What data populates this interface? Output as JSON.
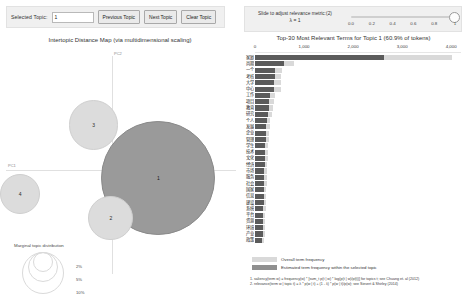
{
  "controls": {
    "selected_topic_label": "Selected Topic:",
    "selected_topic_value": "1",
    "previous_topic": "Previous Topic",
    "next_topic": "Next Topic",
    "clear_topic": "Clear Topic",
    "slider_caption": "Slide to adjust relevance metric:(2)",
    "lambda_label": "λ = 1",
    "slider_ticks": [
      "0.0",
      "0.2",
      "0.4",
      "0.6",
      "0.8",
      "1"
    ],
    "slider_value": 1
  },
  "left_panel": {
    "title": "Intertopic Distance Map (via multidimensional scaling)",
    "axis_x_label": "PC1",
    "axis_y_label": "PC2",
    "marginal_title": "Marginal topic distribution",
    "marginal_sizes": [
      "2%",
      "5%",
      "10%"
    ]
  },
  "right_panel": {
    "title": "Top-30 Most Relevant Terms for Topic 1 (60.9% of tokens)",
    "axis_ticks": [
      "0",
      "1,000",
      "2,000",
      "3,000",
      "4,000"
    ],
    "legend_overall": "Overall term frequency",
    "legend_topic": "Estimated term frequency within the selected topic",
    "footnote1": "1. saliency(term w) = frequency(w) * [sum_t p(t | w) * log(p(t | w)/p(t))] for topics t; see Chuang et. al (2012)",
    "footnote2": "2. relevance(term w | topic t) = λ * p(w | t) + (1 - λ) * p(w | t)/p(w); see Sievert & Shirley (2014)"
  },
  "chart_data": [
    {
      "type": "scatter",
      "title": "Intertopic Distance Map (via multidimensional scaling)",
      "xlabel": "PC1",
      "ylabel": "PC2",
      "grid": false,
      "legend": "bottom-left",
      "selected_topic": 1,
      "points": [
        {
          "label": "1",
          "x": 0.42,
          "y": -0.07,
          "size": 0.61,
          "selected": true
        },
        {
          "label": "3",
          "x": -0.18,
          "y": 0.46,
          "size": 0.16,
          "selected": false
        },
        {
          "label": "2",
          "x": -0.02,
          "y": -0.47,
          "size": 0.13,
          "selected": false
        },
        {
          "label": "4",
          "x": -0.86,
          "y": -0.23,
          "size": 0.1,
          "selected": false
        }
      ]
    },
    {
      "type": "bar",
      "orientation": "horizontal",
      "title": "Top-30 Most Relevant Terms for Topic 1 (60.9% of tokens)",
      "xlabel": "",
      "ylabel": "",
      "xlim": [
        0,
        4200
      ],
      "xticks": [
        0,
        1000,
        2000,
        3000,
        4000
      ],
      "grid": false,
      "legend": "bottom",
      "categories": [
        "家庭",
        "尚期",
        "一个",
        "考核",
        "大学",
        "中心",
        "工作",
        "项目",
        "教育",
        "研究",
        "个人",
        "发展",
        "企业",
        "管理",
        "学生",
        "技术",
        "文化",
        "经济",
        "市场",
        "服务",
        "社会",
        "国家",
        "信息",
        "建设",
        "系统",
        "平台",
        "资源",
        "环境",
        "产业",
        "政策"
      ],
      "series": [
        {
          "name": "Overall term frequency",
          "values": [
            4020,
            800,
            560,
            540,
            530,
            520,
            400,
            380,
            370,
            340,
            310,
            300,
            290,
            280,
            275,
            265,
            258,
            252,
            248,
            242,
            236,
            232,
            228,
            222,
            218,
            214,
            210,
            205,
            198,
            190
          ]
        },
        {
          "name": "Estimated term frequency within the selected topic",
          "values": [
            2620,
            590,
            410,
            400,
            395,
            390,
            300,
            285,
            278,
            255,
            235,
            228,
            222,
            215,
            212,
            205,
            200,
            196,
            193,
            190,
            186,
            182,
            178,
            175,
            172,
            169,
            166,
            163,
            158,
            152
          ]
        }
      ]
    }
  ]
}
